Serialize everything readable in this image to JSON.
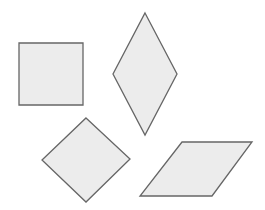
{
  "canvas": {
    "width": 265,
    "height": 210,
    "background": "#ffffff"
  },
  "style": {
    "fill": "#ececec",
    "stroke": "#666666"
  },
  "shapes": [
    {
      "name": "square",
      "kind": "square",
      "points": "19,43 83,43 83,105 19,105"
    },
    {
      "name": "tall-rhombus",
      "kind": "rhombus",
      "points": "145,13 177,74 145,135 113,74"
    },
    {
      "name": "diamond",
      "kind": "rotated-square",
      "points": "86,118 130,159 86,202 42,160"
    },
    {
      "name": "parallelogram",
      "kind": "parallelogram",
      "points": "182,142 252,142 212,196 140,196"
    }
  ]
}
